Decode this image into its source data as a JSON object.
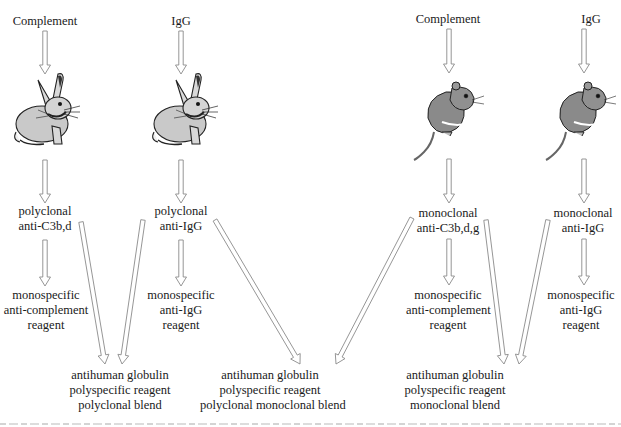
{
  "diagram": {
    "type": "flow",
    "columns": [
      {
        "id": "rabbit-complement",
        "antigen": "Complement",
        "animal": "rabbit",
        "antibody": [
          "polyclonal",
          "anti-C3b,d"
        ],
        "monospecific": [
          "monospecific",
          "anti-complement",
          "reagent"
        ]
      },
      {
        "id": "rabbit-igg",
        "antigen": "IgG",
        "animal": "rabbit",
        "antibody": [
          "polyclonal",
          "anti-IgG"
        ],
        "monospecific": [
          "monospecific",
          "anti-IgG",
          "reagent"
        ]
      },
      {
        "id": "mouse-complement",
        "antigen": "Complement",
        "animal": "mouse",
        "antibody": [
          "monoclonal",
          "anti-C3b,d,g"
        ],
        "monospecific": [
          "monospecific",
          "anti-complement",
          "reagent"
        ]
      },
      {
        "id": "mouse-igg",
        "antigen": "IgG",
        "animal": "mouse",
        "antibody": [
          "monoclonal",
          "anti-IgG"
        ],
        "monospecific": [
          "monospecific",
          "anti-IgG",
          "reagent"
        ]
      }
    ],
    "blends": [
      {
        "id": "polyclonal-blend",
        "lines": [
          "antihuman globulin",
          "polyspecific reagent",
          "polyclonal blend"
        ],
        "inputs": [
          "rabbit-complement",
          "rabbit-igg"
        ]
      },
      {
        "id": "polyclonal-monoclonal-blend",
        "lines": [
          "antihuman globulin",
          "polyspecific reagent",
          "polyclonal monoclonal blend"
        ],
        "inputs": [
          "rabbit-igg",
          "mouse-complement"
        ]
      },
      {
        "id": "monoclonal-blend",
        "lines": [
          "antihuman globulin",
          "polyspecific reagent",
          "monoclonal blend"
        ],
        "inputs": [
          "mouse-complement",
          "mouse-igg"
        ]
      }
    ]
  }
}
